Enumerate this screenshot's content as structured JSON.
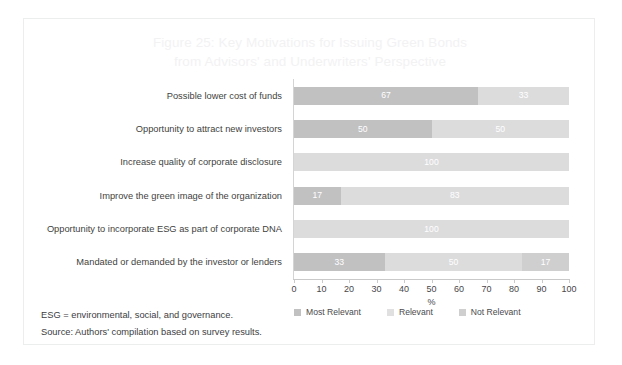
{
  "figure": {
    "title_line1": "Figure 25: Key Motivations for Issuing Green Bonds",
    "title_line2": "from Advisors' and Underwriters' Perspective",
    "note_1": "ESG = environmental, social, and governance.",
    "note_2": "Source: Authors' compilation based on survey results."
  },
  "colors": {
    "most_relevant": "#c1c1c2",
    "relevant": "#dcdcdd",
    "not_relevant": "#cfcfd0",
    "title_text": "#f2f2f3",
    "label_text": "#3f3f41",
    "frame_border": "#eceded"
  },
  "chart_data": {
    "type": "bar",
    "orientation": "horizontal",
    "stacked": true,
    "title": "Figure 25: Key Motivations for Issuing Green Bonds from Advisors' and Underwriters' Perspective",
    "xlabel": "%",
    "ylabel": "",
    "xlim": [
      0,
      100
    ],
    "xticks": [
      "0",
      "10",
      "20",
      "30",
      "40",
      "50",
      "60",
      "70",
      "80",
      "90",
      "100"
    ],
    "grid": false,
    "legend_position": "bottom",
    "categories": [
      "Possible lower cost of funds",
      "Opportunity to attract new investors",
      "Increase quality of corporate disclosure",
      "Improve the green image of the organization",
      "Opportunity to incorporate ESG as part of corporate DNA",
      "Mandated or demanded by the investor or lenders"
    ],
    "series": [
      {
        "name": "Most Relevant",
        "values": [
          67,
          50,
          0,
          17,
          0,
          33
        ]
      },
      {
        "name": "Relevant",
        "values": [
          33,
          50,
          100,
          83,
          100,
          50
        ]
      },
      {
        "name": "Not Relevant",
        "values": [
          0,
          0,
          0,
          0,
          0,
          17
        ]
      }
    ],
    "bar_labels": [
      [
        {
          "series": 0,
          "value": "67"
        },
        {
          "series": 1,
          "value": "33"
        }
      ],
      [
        {
          "series": 0,
          "value": "50"
        },
        {
          "series": 1,
          "value": "50"
        }
      ],
      [
        {
          "series": 1,
          "value": "100"
        }
      ],
      [
        {
          "series": 0,
          "value": "17"
        },
        {
          "series": 1,
          "value": "83"
        }
      ],
      [
        {
          "series": 1,
          "value": "100"
        }
      ],
      [
        {
          "series": 0,
          "value": "33"
        },
        {
          "series": 1,
          "value": "50"
        },
        {
          "series": 2,
          "value": "17"
        }
      ]
    ]
  }
}
